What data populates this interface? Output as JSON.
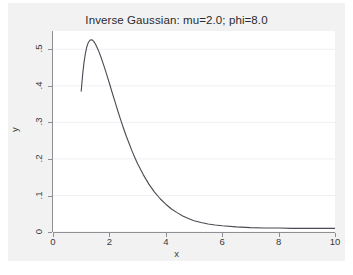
{
  "chart_data": {
    "type": "line",
    "title": "Inverse Gaussian: mu=2.0; phi=8.0",
    "xlabel": "x",
    "ylabel": "y",
    "xlim": [
      0,
      10
    ],
    "ylim": [
      0,
      0.55
    ],
    "grid": true,
    "grid_orientation": "horizontal",
    "legend": "none",
    "line_color": "#4a4a52",
    "background_color": "#f2f2f3",
    "plot_background_color": "#ffffff",
    "axis_color": "#8e8e93",
    "xticks": [
      "0",
      "2",
      "4",
      "6",
      "8",
      "10"
    ],
    "xtick_values": [
      0,
      2,
      4,
      6,
      8,
      10
    ],
    "yticks": [
      "0",
      ".1",
      ".2",
      ".3",
      ".4",
      ".5"
    ],
    "ytick_values": [
      0,
      0.1,
      0.2,
      0.3,
      0.4,
      0.5
    ],
    "series": [
      {
        "name": "Inverse Gaussian density (mu=2.0, phi=8.0)",
        "x": [
          1.0,
          1.05,
          1.1,
          1.15,
          1.2,
          1.25,
          1.3,
          1.35,
          1.4,
          1.45,
          1.5,
          1.6,
          1.7,
          1.8,
          1.9,
          2.0,
          2.1,
          2.2,
          2.3,
          2.4,
          2.5,
          2.6,
          2.7,
          2.8,
          2.9,
          3.0,
          3.2,
          3.4,
          3.6,
          3.8,
          4.0,
          4.2,
          4.4,
          4.6,
          4.8,
          5.0,
          5.25,
          5.5,
          5.75,
          6.0,
          6.5,
          7.0,
          7.5,
          8.0,
          8.5,
          9.0,
          9.5,
          10.0
        ],
        "y": [
          0.385,
          0.43,
          0.464,
          0.489,
          0.507,
          0.518,
          0.524,
          0.526,
          0.525,
          0.521,
          0.515,
          0.499,
          0.479,
          0.456,
          0.432,
          0.407,
          0.381,
          0.356,
          0.331,
          0.307,
          0.284,
          0.262,
          0.242,
          0.222,
          0.204,
          0.187,
          0.157,
          0.131,
          0.109,
          0.091,
          0.076,
          0.063,
          0.053,
          0.044,
          0.037,
          0.031,
          0.026,
          0.022,
          0.019,
          0.017,
          0.014,
          0.012,
          0.011,
          0.011,
          0.01,
          0.01,
          0.01,
          0.01
        ]
      }
    ]
  },
  "title": {
    "text": "Inverse Gaussian: mu=2.0; phi=8.0"
  },
  "axes": {
    "x": {
      "label": "x",
      "ticks": [
        "0",
        "2",
        "4",
        "6",
        "8",
        "10"
      ]
    },
    "y": {
      "label": "y",
      "ticks": [
        "0",
        ".1",
        ".2",
        ".3",
        ".4",
        ".5"
      ]
    }
  }
}
